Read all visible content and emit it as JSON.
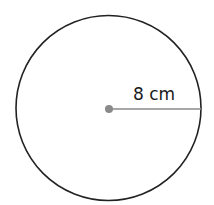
{
  "diagram": {
    "shape": "circle",
    "radius_label": "8 cm",
    "radius_value": 8,
    "radius_unit": "cm",
    "colors": {
      "outline": "#222222",
      "radius_line": "#8a8a8a",
      "center_dot": "#8a8a8a",
      "background": "#ffffff"
    }
  }
}
